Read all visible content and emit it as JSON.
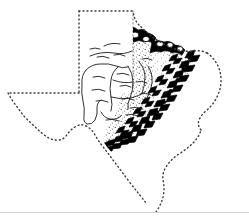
{
  "figure": {
    "kind": "line-drawing-map",
    "background_color": "#ffffff",
    "ink_color": "#000000",
    "rule_color": "#d6d6d6",
    "width": 249,
    "height": 224
  },
  "map": {
    "state_outline": {
      "name": "texas-state-outline",
      "style": "dotted",
      "stroke_color": "#3a3a3a",
      "dash_pattern": "1 3",
      "stroke_width": 1.4,
      "fill": "none"
    },
    "regions": [
      {
        "name": "stippled-upland-region",
        "pattern": "stipple",
        "stroke_color": "#000000",
        "fill": "none",
        "description": "dotted/stippled texture zone along the eastern and northeastern margin of the plateau"
      },
      {
        "name": "plateau-interior-region",
        "pattern": "open",
        "stroke_color": "#000000",
        "fill": "#ffffff",
        "description": "open white interior bounded by free-hand contour lines"
      }
    ],
    "escarpment": {
      "name": "balcones-escarpment-hachure",
      "symbol": "thrust-teeth",
      "color": "#000000",
      "description": "heavy black toothed/hachured band tracing the escarpment from the north-central border southwest to the south-central interior"
    },
    "contour_lines": {
      "name": "interior-contour-lines",
      "color": "#1a1a1a",
      "stroke_width": 0.9,
      "description": "thin free-hand contour and drainage lines inside the plateau"
    },
    "tick_marks": {
      "name": "interior-short-dashes",
      "color": "#1a1a1a",
      "description": "short horizontal dashes indicating relief / water features"
    }
  },
  "caption_rule": {
    "name": "caption-divider-rule",
    "visible": true,
    "y": 212
  }
}
